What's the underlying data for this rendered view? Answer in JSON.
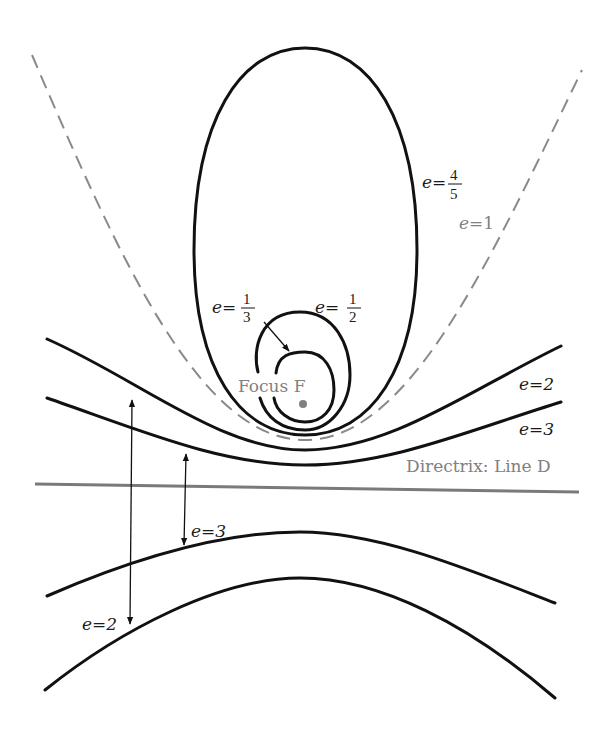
{
  "diagram": {
    "colors": {
      "curve": "#111111",
      "parabola": "#8a8a8a",
      "directrix": "#7a7a7a",
      "focus": "#808080",
      "label_gray": "#808080"
    },
    "focus": {
      "label": "Focus F"
    },
    "directrix": {
      "label": "Directrix: Line D"
    },
    "curves": [
      {
        "type": "ellipse",
        "eccentricity": "4/5",
        "label_prefix": "e=",
        "num": "4",
        "den": "5"
      },
      {
        "type": "ellipse",
        "eccentricity": "1/2",
        "label_prefix": "e=",
        "num": "1",
        "den": "2"
      },
      {
        "type": "ellipse",
        "eccentricity": "1/3",
        "label_prefix": "e=",
        "num": "1",
        "den": "3"
      },
      {
        "type": "parabola",
        "eccentricity": "1",
        "label": "e=1"
      },
      {
        "type": "hyperbola",
        "eccentricity": "2",
        "label": "e=2"
      },
      {
        "type": "hyperbola",
        "eccentricity": "3",
        "label": "e=3"
      }
    ],
    "lower_labels": {
      "e3": "e=3",
      "e2": "e=2"
    }
  }
}
